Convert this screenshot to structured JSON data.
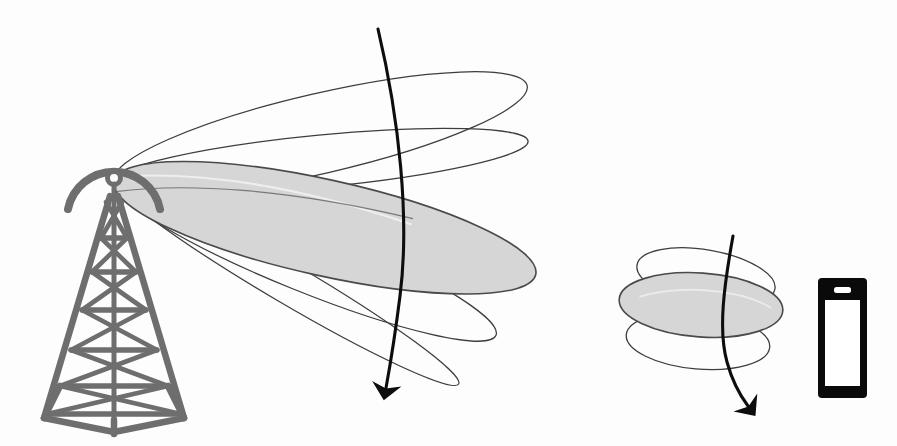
{
  "diagram": {
    "background_color": "#fdfdfd",
    "canvas": {
      "width": 897,
      "height": 446
    }
  },
  "colors": {
    "tower_gray": "#6e6e6e",
    "lobe_fill": "#d6d6d6",
    "lobe_stroke": "#4a4a4a",
    "thin_stroke": "#3d3d3d",
    "arrow_black": "#0d0d0d",
    "phone_body": "#0a0a0a",
    "phone_screen": "#ffffff",
    "speaker_slot": "#ffffff"
  },
  "tower": {
    "label": "cell-tower",
    "tip": {
      "x": 113,
      "y": 180
    },
    "base_y": 420,
    "mast_color": "#6e6e6e",
    "has_antenna_arc": true,
    "has_antenna_knob": true,
    "lattice_levels": 6
  },
  "transmitter_beams": {
    "label": "transmitter-radiation-pattern",
    "origin": {
      "x": 114,
      "y": 181
    },
    "main_lobe": {
      "name": "main-lobe",
      "filled": true,
      "fill": "#d6d6d6",
      "tilt_deg": 13,
      "length": 430,
      "half_width": 48
    },
    "side_lobes": [
      {
        "name": "upper-side-lobe-1",
        "filled": false,
        "tilt_deg": -13,
        "length": 420,
        "half_width": 40
      },
      {
        "name": "upper-side-lobe-2",
        "filled": false,
        "tilt_deg": -5,
        "length": 415,
        "half_width": 26
      },
      {
        "name": "lower-side-lobe-1",
        "filled": false,
        "tilt_deg": 22,
        "length": 410,
        "half_width": 32
      },
      {
        "name": "lower-side-lobe-2",
        "filled": false,
        "tilt_deg": 30,
        "length": 400,
        "half_width": 20
      }
    ]
  },
  "transmitter_arrow": {
    "label": "transmitter-wavefront-arrow",
    "start": {
      "x": 378,
      "y": 29
    },
    "end": {
      "x": 385,
      "y": 397
    },
    "color": "#0d0d0d",
    "stroke_width": 3.1,
    "has_arrowhead": true
  },
  "receiver_beams": {
    "label": "receiver-radiation-pattern",
    "center": {
      "x": 702,
      "y": 320
    },
    "main_lobe": {
      "name": "receiver-main-lobe",
      "filled": true,
      "fill": "#d6d6d6",
      "cx": 700,
      "cy": 304,
      "rx": 82,
      "ry": 32,
      "tilt_deg": 5
    },
    "side_lobes": [
      {
        "name": "receiver-upper-lobe",
        "filled": false,
        "cx": 706,
        "cy": 276,
        "rx": 70,
        "ry": 27,
        "tilt_deg": 12
      },
      {
        "name": "receiver-lower-lobe",
        "filled": false,
        "cx": 698,
        "cy": 340,
        "rx": 72,
        "ry": 28,
        "tilt_deg": 6
      }
    ]
  },
  "receiver_arrow": {
    "label": "receiver-wavefront-arrow",
    "start": {
      "x": 733,
      "y": 236
    },
    "end": {
      "x": 752,
      "y": 414
    },
    "color": "#0d0d0d",
    "stroke_width": 3.1,
    "has_arrowhead": true
  },
  "phone": {
    "label": "mobile-handset",
    "x": 818,
    "y": 278,
    "width": 49,
    "height": 120,
    "body_color": "#0a0a0a",
    "screen_color": "#ffffff",
    "screen_inset": {
      "top": 22,
      "side": 7,
      "bottom": 12
    },
    "speaker": {
      "width": 17,
      "height": 6,
      "offset_y": 9
    },
    "corner_radius": 4
  }
}
